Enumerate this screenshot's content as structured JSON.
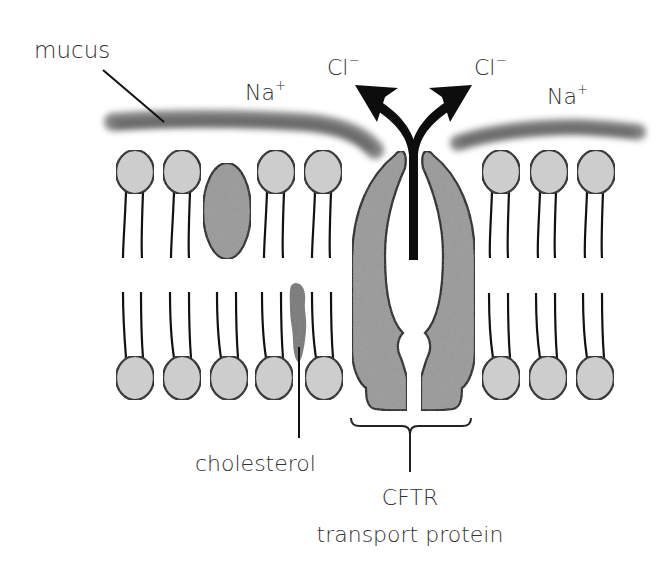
{
  "diagram": {
    "labels": {
      "mucus": "mucus",
      "na_left": "Na",
      "na_left_charge": "+",
      "na_right": "Na",
      "na_right_charge": "+",
      "cl_left": "Cl",
      "cl_left_charge": "−",
      "cl_right": "Cl",
      "cl_right_charge": "−",
      "cholesterol": "cholesterol",
      "cftr_line1": "CFTR",
      "cftr_line2": "transport protein"
    },
    "colors": {
      "phospholipid_head": "#cfcfcf",
      "protein_fill": "#999999",
      "cholesterol_fill": "#777777",
      "mucus": "#6e6e6e",
      "outline": "#111111",
      "arrow": "#0d0d0d",
      "text": "#333333"
    },
    "components": [
      "mucus layer",
      "phospholipid bilayer",
      "membrane protein",
      "cholesterol",
      "CFTR transport protein",
      "chloride ion arrows"
    ]
  }
}
